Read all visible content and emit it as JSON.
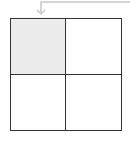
{
  "diagram": {
    "type": "2x2 grid",
    "rows": 2,
    "cols": 2,
    "cells": [
      {
        "row": 0,
        "col": 0,
        "highlighted": true,
        "fill": "#ececec"
      },
      {
        "row": 0,
        "col": 1,
        "highlighted": false,
        "fill": "#ffffff"
      },
      {
        "row": 1,
        "col": 0,
        "highlighted": false,
        "fill": "#ffffff"
      },
      {
        "row": 1,
        "col": 1,
        "highlighted": false,
        "fill": "#ffffff"
      }
    ],
    "arrow": {
      "points_to": "top-left cell",
      "color": "#c8c8c8"
    },
    "colors": {
      "border": "#333333",
      "highlight": "#ececec",
      "arrow": "#c8c8c8"
    }
  }
}
